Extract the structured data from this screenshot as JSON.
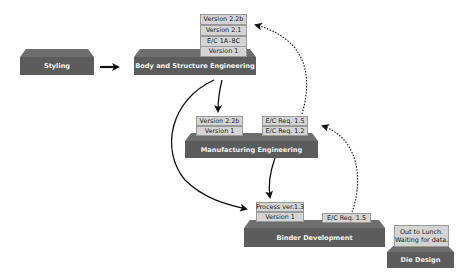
{
  "colors": {
    "stage_body": "#5c5c5c",
    "stage_lid": "#6e6e6e",
    "tag_bg": "#d4d4d4",
    "tag_border": "#9a9a9a",
    "arrow": "#111111"
  },
  "stages": {
    "styling": {
      "label": "Styling"
    },
    "body_structure": {
      "label": "Body and Structure Engineering",
      "tags": [
        "Version 2.2b",
        "Version 2.1",
        "E/C 1A–8C",
        "Version 1"
      ]
    },
    "manufacturing": {
      "label": "Manufacturing Engineering",
      "tags_left": [
        "Version 2.2b",
        "Version 1"
      ],
      "tags_right": [
        "E/C Req. 1.5",
        "E/C Req. 1.2"
      ]
    },
    "binder": {
      "label": "Binder Development",
      "tags_left": [
        "Process ver.1.3",
        "Version 1"
      ],
      "tags_right": [
        "E/C Req. 1.5"
      ]
    },
    "die": {
      "label": "Die Design",
      "note_line1": "Out to Lunch.",
      "note_line2": "Waiting for data."
    }
  },
  "arrows": [
    {
      "from": "Styling",
      "to": "Body and Structure Engineering",
      "style": "solid"
    },
    {
      "from": "Body and Structure Engineering",
      "to": "Manufacturing Engineering",
      "style": "solid"
    },
    {
      "from": "Body and Structure Engineering",
      "to": "Binder Development",
      "style": "solid"
    },
    {
      "from": "Manufacturing Engineering",
      "to": "Binder Development",
      "style": "solid"
    },
    {
      "from": "Manufacturing Engineering",
      "to": "Body and Structure Engineering",
      "style": "dotted"
    },
    {
      "from": "Binder Development",
      "to": "Manufacturing Engineering",
      "style": "dotted"
    }
  ]
}
